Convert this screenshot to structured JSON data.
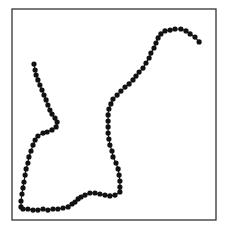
{
  "chart_data": {
    "type": "line",
    "title": "",
    "xlabel": "",
    "ylabel": "",
    "xlim": [
      0,
      100
    ],
    "ylim": [
      0,
      100
    ],
    "grid": false,
    "legend": null,
    "axes_ticks_visible": false,
    "marker": "circle",
    "colors": {
      "line": "#1a1a1a",
      "marker": "#111111",
      "frame": "#333333",
      "background": "#ffffff"
    },
    "series": [
      {
        "name": "trajectory",
        "points": [
          [
            10.8,
            73.9
          ],
          [
            11.3,
            71.1
          ],
          [
            11.8,
            68.7
          ],
          [
            12.7,
            66.4
          ],
          [
            13.7,
            64.0
          ],
          [
            14.7,
            61.6
          ],
          [
            15.7,
            59.2
          ],
          [
            16.7,
            56.9
          ],
          [
            17.6,
            54.5
          ],
          [
            18.6,
            52.1
          ],
          [
            19.6,
            50.2
          ],
          [
            21.1,
            48.3
          ],
          [
            22.1,
            46.4
          ],
          [
            21.6,
            44.1
          ],
          [
            19.6,
            42.7
          ],
          [
            17.2,
            41.7
          ],
          [
            15.2,
            41.2
          ],
          [
            12.7,
            39.8
          ],
          [
            11.3,
            37.9
          ],
          [
            10.3,
            35.5
          ],
          [
            9.3,
            32.7
          ],
          [
            8.3,
            29.9
          ],
          [
            7.8,
            27.0
          ],
          [
            6.9,
            24.2
          ],
          [
            6.4,
            21.3
          ],
          [
            5.9,
            18.0
          ],
          [
            5.4,
            15.2
          ],
          [
            4.9,
            12.3
          ],
          [
            4.4,
            9.0
          ],
          [
            4.4,
            6.2
          ],
          [
            5.4,
            5.2
          ],
          [
            7.8,
            5.2
          ],
          [
            10.3,
            4.7
          ],
          [
            12.7,
            4.7
          ],
          [
            15.2,
            5.2
          ],
          [
            17.6,
            4.7
          ],
          [
            20.1,
            5.2
          ],
          [
            22.5,
            5.2
          ],
          [
            25.0,
            5.7
          ],
          [
            27.5,
            6.2
          ],
          [
            29.4,
            7.6
          ],
          [
            30.9,
            8.5
          ],
          [
            32.4,
            10.0
          ],
          [
            33.8,
            10.9
          ],
          [
            35.8,
            11.8
          ],
          [
            38.2,
            12.8
          ],
          [
            40.7,
            12.8
          ],
          [
            43.1,
            12.3
          ],
          [
            45.6,
            11.8
          ],
          [
            48.0,
            11.4
          ],
          [
            50.5,
            11.8
          ],
          [
            52.9,
            13.3
          ],
          [
            52.9,
            15.6
          ],
          [
            52.9,
            18.5
          ],
          [
            52.5,
            21.3
          ],
          [
            52.0,
            24.2
          ],
          [
            51.0,
            27.0
          ],
          [
            49.5,
            29.9
          ],
          [
            49.0,
            32.7
          ],
          [
            48.0,
            35.5
          ],
          [
            47.5,
            38.4
          ],
          [
            47.1,
            41.2
          ],
          [
            47.1,
            44.1
          ],
          [
            47.1,
            46.9
          ],
          [
            47.1,
            49.8
          ],
          [
            47.5,
            52.6
          ],
          [
            48.5,
            55.0
          ],
          [
            49.5,
            57.3
          ],
          [
            51.5,
            59.2
          ],
          [
            53.4,
            61.1
          ],
          [
            55.4,
            63.0
          ],
          [
            57.4,
            64.5
          ],
          [
            59.3,
            66.4
          ],
          [
            60.8,
            68.2
          ],
          [
            62.3,
            70.1
          ],
          [
            64.2,
            72.0
          ],
          [
            65.7,
            74.4
          ],
          [
            67.2,
            76.8
          ],
          [
            68.1,
            79.1
          ],
          [
            69.6,
            81.5
          ],
          [
            70.6,
            83.9
          ],
          [
            71.6,
            86.3
          ],
          [
            73.0,
            88.2
          ],
          [
            75.0,
            89.6
          ],
          [
            77.5,
            90.0
          ],
          [
            79.9,
            90.5
          ],
          [
            82.8,
            90.5
          ],
          [
            85.3,
            89.6
          ],
          [
            87.3,
            88.2
          ],
          [
            89.7,
            86.7
          ],
          [
            91.7,
            84.4
          ]
        ]
      }
    ]
  }
}
